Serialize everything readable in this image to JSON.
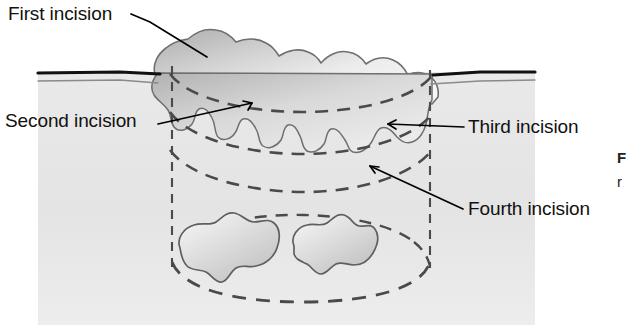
{
  "figure": {
    "kind": "surgical-cross-section-diagram",
    "width": 642,
    "height": 325,
    "background_color": "#ffffff"
  },
  "labels": {
    "first": "First incision",
    "second": "Second incision",
    "third": "Third incision",
    "fourth": "Fourth incision"
  },
  "caption": {
    "line1": "F",
    "line2": "r"
  },
  "colors": {
    "tissue_fill": "#e6e6e6",
    "tissue_fill_dark": "#d2d2d2",
    "lesion_fill_light": "#f2f2f2",
    "lesion_fill_mid": "#d8d8d8",
    "lesion_fill_dark": "#bdbdbd",
    "nodule_fill": "#dcdcdc",
    "outline": "#6a6a6a",
    "dashed_line": "#4a4a4a",
    "surface_line": "#111111",
    "leader_line": "#000000",
    "text": "#111111"
  },
  "anatomy": {
    "skin_surface_left": {
      "x1": 38,
      "x2": 162,
      "y": 72
    },
    "skin_surface_right": {
      "x1": 432,
      "x2": 535,
      "y": 72
    },
    "dermis_line_offset": 8,
    "tissue_block": {
      "left": 38,
      "right": 535,
      "top": 72,
      "bottom": 325
    },
    "lesion_bounds": {
      "left": 150,
      "right": 440,
      "top": 28,
      "bottom": 150
    },
    "deep_nodules": [
      {
        "cx": 228,
        "cy": 252,
        "rx": 52,
        "ry": 30
      },
      {
        "cx": 330,
        "cy": 250,
        "rx": 42,
        "ry": 28
      }
    ],
    "excision_cylinder": {
      "left_wall_x": 172,
      "right_wall_x": 430,
      "top_y": 66,
      "bottom_y": 268,
      "base_ellipse_ry": 34
    },
    "incision_planes": [
      {
        "name": "first",
        "ellipse_y": 92,
        "ry": 22
      },
      {
        "name": "second",
        "ellipse_y": 130,
        "ry": 24
      },
      {
        "name": "third",
        "ellipse_y": 166,
        "ry": 26
      },
      {
        "name": "fourth",
        "ellipse_y": 268,
        "ry": 34
      }
    ]
  },
  "leaders": {
    "first": {
      "from": [
        131,
        14
      ],
      "to": [
        206,
        57
      ]
    },
    "second": {
      "from": [
        158,
        122
      ],
      "to": [
        250,
        104
      ]
    },
    "third": {
      "from": [
        463,
        127
      ],
      "to": [
        389,
        123
      ]
    },
    "fourth": {
      "from": [
        463,
        208
      ],
      "to": [
        369,
        165
      ]
    }
  }
}
